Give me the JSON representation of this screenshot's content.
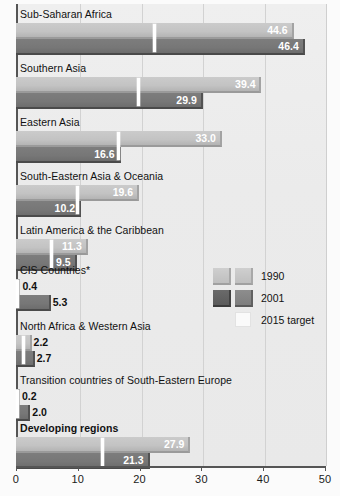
{
  "chart_data": {
    "type": "bar",
    "orientation": "horizontal",
    "title": "",
    "xlabel": "",
    "ylabel": "",
    "xlim": [
      0,
      50
    ],
    "xticks": [
      0,
      10,
      20,
      30,
      40,
      50
    ],
    "xtick_labels": [
      "0",
      "10",
      "20",
      "30",
      "40",
      "50"
    ],
    "grid": true,
    "legend_position": "middle-right",
    "categories": [
      "Sub-Saharan Africa",
      "Southern Asia",
      "Eastern Asia",
      "South-Eastern Asia & Oceania",
      "Latin America & the Caribbean",
      "CIS Countries*",
      "North Africa & Western Asia",
      "Transition countries of South-Eastern Europe",
      "Developing regions"
    ],
    "series": [
      {
        "name": "1990",
        "color": "#c5c5c5",
        "values": [
          44.6,
          39.4,
          33.0,
          19.6,
          11.3,
          0.4,
          2.2,
          0.2,
          27.9
        ],
        "labels": [
          "44.6",
          "39.4",
          "33.0",
          "19.6",
          "11.3",
          "0.4",
          "2.2",
          "0.2",
          "27.9"
        ]
      },
      {
        "name": "2001",
        "color": "#777777",
        "values": [
          46.4,
          29.9,
          16.6,
          10.2,
          9.5,
          5.3,
          2.7,
          2.0,
          21.3
        ],
        "labels": [
          "46.4",
          "29.9",
          "16.6",
          "10.2",
          "9.5",
          "5.3",
          "2.7",
          "2.0",
          "21.3"
        ]
      },
      {
        "name": "2015 target",
        "color": "#ffffff",
        "values": [
          22.3,
          19.7,
          16.5,
          9.8,
          5.65,
          0.2,
          1.1,
          0.1,
          13.95
        ],
        "labels": [
          "",
          "",
          "",
          "",
          "",
          "",
          "",
          "",
          ""
        ]
      }
    ]
  },
  "legend": {
    "items": [
      {
        "label": "1990",
        "swatch_a": "light",
        "swatch_b": "light"
      },
      {
        "label": "2001",
        "swatch_a": "dark",
        "swatch_b": "mid"
      },
      {
        "label": "2015 target",
        "swatch_a": "",
        "swatch_b": "white"
      }
    ]
  },
  "rows": [
    {
      "label": "Sub-Saharan Africa",
      "bold": false,
      "v1990": "44.6",
      "v2001": "46.4",
      "val1990": 44.6,
      "val2001": 46.4,
      "target": 22.3
    },
    {
      "label": "Southern Asia",
      "bold": false,
      "v1990": "39.4",
      "v2001": "29.9",
      "val1990": 39.4,
      "val2001": 29.9,
      "target": 19.7
    },
    {
      "label": "Eastern Asia",
      "bold": false,
      "v1990": "33.0",
      "v2001": "16.6",
      "val1990": 33.0,
      "val2001": 16.6,
      "target": 16.5
    },
    {
      "label": "South-Eastern Asia & Oceania",
      "bold": false,
      "v1990": "19.6",
      "v2001": "10.2",
      "val1990": 19.6,
      "val2001": 10.2,
      "target": 9.8
    },
    {
      "label": "Latin America & the Caribbean",
      "bold": false,
      "v1990": "11.3",
      "v2001": "9.5",
      "val1990": 11.3,
      "val2001": 9.5,
      "target": 5.65
    },
    {
      "label": "CIS Countries*",
      "bold": false,
      "v1990": "0.4",
      "v2001": "5.3",
      "val1990": 0.4,
      "val2001": 5.3,
      "target": 0.2
    },
    {
      "label": "North Africa & Western Asia",
      "bold": false,
      "v1990": "2.2",
      "v2001": "2.7",
      "val1990": 2.2,
      "val2001": 2.7,
      "target": 1.1
    },
    {
      "label": "Transition countries of South-Eastern Europe",
      "bold": false,
      "v1990": "0.2",
      "v2001": "2.0",
      "val1990": 0.2,
      "val2001": 2.0,
      "target": 0.1
    },
    {
      "label": "Developing regions",
      "bold": true,
      "v1990": "27.9",
      "v2001": "21.3",
      "val1990": 27.9,
      "val2001": 21.3,
      "target": 13.95
    }
  ],
  "axis": {
    "ticks": [
      "0",
      "10",
      "20",
      "30",
      "40",
      "50"
    ]
  }
}
